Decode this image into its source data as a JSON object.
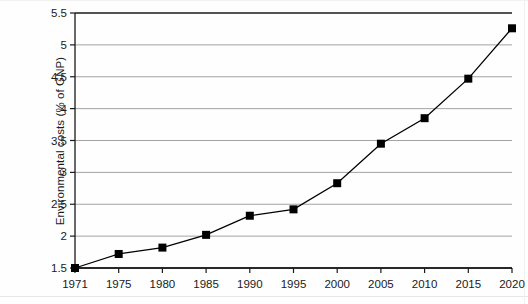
{
  "chart_data": {
    "type": "line",
    "title": "",
    "xlabel": "",
    "ylabel": "Environmental costs (% of GNP)",
    "grid": true,
    "legend": "none",
    "marker": "square",
    "line_color": "#000000",
    "marker_color": "#000000",
    "grid_color": "#999999",
    "axis_color": "#1a1a1a",
    "categories": [
      "1971",
      "1975",
      "1980",
      "1985",
      "1990",
      "1995",
      "2000",
      "2005",
      "2010",
      "2015",
      "2020"
    ],
    "x": [
      1971,
      1975,
      1980,
      1985,
      1990,
      1995,
      2000,
      2005,
      2010,
      2015,
      2020
    ],
    "values": [
      1.5,
      1.72,
      1.82,
      2.02,
      2.32,
      2.42,
      2.83,
      3.45,
      3.85,
      4.47,
      5.26
    ],
    "series": [
      {
        "name": "Environmental costs",
        "values": [
          1.5,
          1.72,
          1.82,
          2.02,
          2.32,
          2.42,
          2.83,
          3.45,
          3.85,
          4.47,
          5.26
        ]
      }
    ],
    "ylim": [
      1.5,
      5.5
    ],
    "ytick_values": [
      1.5,
      2,
      2.5,
      3,
      3.5,
      4,
      4.5,
      5,
      5.5
    ],
    "ytick_labels": [
      "1.5",
      "2",
      "2.5",
      "3",
      "3.5",
      "4",
      "4.5",
      "5",
      "5.5"
    ],
    "xtick_labels": [
      "1971",
      "1975",
      "1980",
      "1985",
      "1990",
      "1995",
      "2000",
      "2005",
      "2010",
      "2015",
      "2020"
    ]
  },
  "plot": {
    "left": 75,
    "right": 512,
    "top": 13,
    "bottom": 268,
    "marker_size": 8
  }
}
